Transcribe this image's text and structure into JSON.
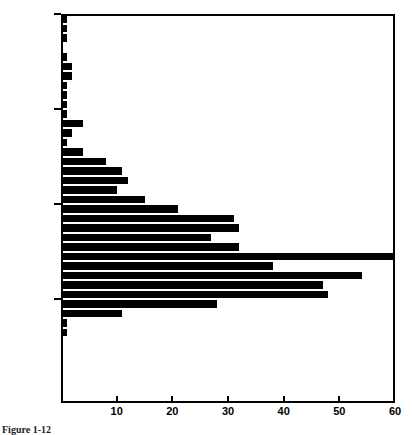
{
  "figure": {
    "caption": "Figure 1-12"
  },
  "chart_data": {
    "type": "bar",
    "orientation": "horizontal",
    "title": "",
    "xlabel": "",
    "ylabel": "",
    "xlim": [
      0,
      60
    ],
    "ylim": [
      0,
      200000
    ],
    "xticks": [
      0,
      10,
      20,
      30,
      40,
      50,
      60
    ],
    "xticklabels": [
      "",
      "10",
      "20",
      "30",
      "40",
      "50",
      "60"
    ],
    "yticks": [
      50000,
      100000,
      150000,
      200000
    ],
    "yticklabels": [
      "$50,000",
      "$100,000",
      "$150,000",
      "$200,000"
    ],
    "grid": false,
    "legend": null,
    "bin_width": 5000,
    "bar_color": "#000000",
    "categories": [
      "195,000",
      "190,000",
      "185,000",
      "180,000",
      "175,000",
      "170,000",
      "165,000",
      "160,000",
      "155,000",
      "150,000",
      "145,000",
      "140,000",
      "135,000",
      "130,000",
      "125,000",
      "120,000",
      "115,000",
      "110,000",
      "105,000",
      "100,000",
      "95,000",
      "90,000",
      "85,000",
      "80,000",
      "75,000",
      "70,000",
      "65,000",
      "60,000",
      "55,000",
      "50,000",
      "45,000",
      "40,000",
      "35,000",
      "30,000",
      "25,000",
      "20,000"
    ],
    "bars": [
      {
        "y_top": 200000,
        "y_bottom": 195000,
        "value": 1
      },
      {
        "y_top": 195000,
        "y_bottom": 190000,
        "value": 1
      },
      {
        "y_top": 190000,
        "y_bottom": 185000,
        "value": 1
      },
      {
        "y_top": 185000,
        "y_bottom": 180000,
        "value": 0
      },
      {
        "y_top": 180000,
        "y_bottom": 175000,
        "value": 1
      },
      {
        "y_top": 175000,
        "y_bottom": 170000,
        "value": 2
      },
      {
        "y_top": 170000,
        "y_bottom": 165000,
        "value": 2
      },
      {
        "y_top": 165000,
        "y_bottom": 160000,
        "value": 1
      },
      {
        "y_top": 160000,
        "y_bottom": 155000,
        "value": 1
      },
      {
        "y_top": 155000,
        "y_bottom": 150000,
        "value": 1
      },
      {
        "y_top": 150000,
        "y_bottom": 145000,
        "value": 1
      },
      {
        "y_top": 145000,
        "y_bottom": 140000,
        "value": 4
      },
      {
        "y_top": 140000,
        "y_bottom": 135000,
        "value": 2
      },
      {
        "y_top": 135000,
        "y_bottom": 130000,
        "value": 1
      },
      {
        "y_top": 130000,
        "y_bottom": 125000,
        "value": 4
      },
      {
        "y_top": 125000,
        "y_bottom": 120000,
        "value": 8
      },
      {
        "y_top": 120000,
        "y_bottom": 115000,
        "value": 11
      },
      {
        "y_top": 115000,
        "y_bottom": 110000,
        "value": 12
      },
      {
        "y_top": 110000,
        "y_bottom": 105000,
        "value": 10
      },
      {
        "y_top": 105000,
        "y_bottom": 100000,
        "value": 15
      },
      {
        "y_top": 100000,
        "y_bottom": 95000,
        "value": 21
      },
      {
        "y_top": 95000,
        "y_bottom": 90000,
        "value": 31
      },
      {
        "y_top": 90000,
        "y_bottom": 85000,
        "value": 32
      },
      {
        "y_top": 85000,
        "y_bottom": 80000,
        "value": 27
      },
      {
        "y_top": 80000,
        "y_bottom": 75000,
        "value": 32
      },
      {
        "y_top": 75000,
        "y_bottom": 70000,
        "value": 60
      },
      {
        "y_top": 70000,
        "y_bottom": 65000,
        "value": 38
      },
      {
        "y_top": 65000,
        "y_bottom": 60000,
        "value": 54
      },
      {
        "y_top": 60000,
        "y_bottom": 55000,
        "value": 47
      },
      {
        "y_top": 55000,
        "y_bottom": 50000,
        "value": 48
      },
      {
        "y_top": 50000,
        "y_bottom": 45000,
        "value": 28
      },
      {
        "y_top": 45000,
        "y_bottom": 40000,
        "value": 11
      },
      {
        "y_top": 40000,
        "y_bottom": 35000,
        "value": 1
      },
      {
        "y_top": 35000,
        "y_bottom": 30000,
        "value": 1
      },
      {
        "y_top": 30000,
        "y_bottom": 25000,
        "value": 0
      },
      {
        "y_top": 25000,
        "y_bottom": 20000,
        "value": 0
      }
    ]
  }
}
